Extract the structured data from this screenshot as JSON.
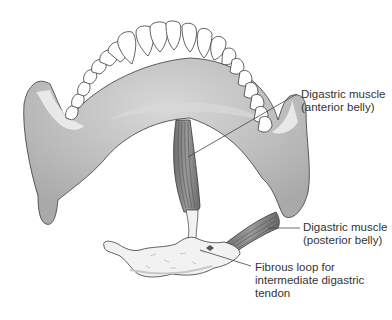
{
  "figure": {
    "colors": {
      "bone": "#b9b9b9",
      "bone_highlight": "#e6e6e6",
      "teeth": "#ffffff",
      "outline": "#3a3a3a",
      "muscle": "#8a8a8a",
      "hyoid": "#f2f2f2",
      "leader_line": "#444444",
      "text": "#333333"
    }
  },
  "labels": [
    {
      "id": "anterior-belly",
      "lines": [
        "Digastric muscle",
        "(anterior belly)"
      ]
    },
    {
      "id": "posterior-belly",
      "lines": [
        "Digastric muscle",
        "(posterior belly)"
      ]
    },
    {
      "id": "fibrous-loop",
      "lines": [
        "Fibrous loop for",
        "intermediate digastric",
        "tendon"
      ]
    }
  ]
}
